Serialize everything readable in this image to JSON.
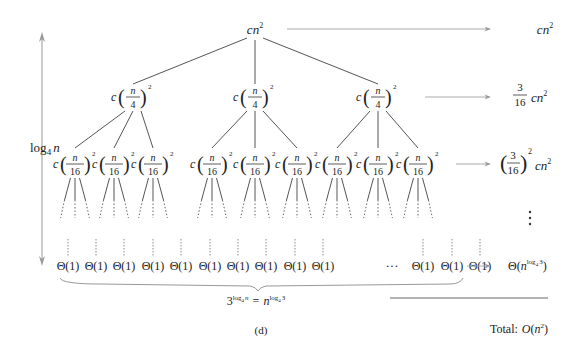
{
  "figure": {
    "caption": "(d)",
    "root": {
      "c": "c",
      "n": "n",
      "exp": "2"
    },
    "level1_node": {
      "c": "c",
      "num": "n",
      "den": "4",
      "exp": "2"
    },
    "level2_node": {
      "c": "c",
      "num": "n",
      "den": "16",
      "exp": "2"
    },
    "leaf_label": "Θ(1)",
    "ellipsis": "···",
    "height_label": {
      "base": "log",
      "sub": "4",
      "arg": "n"
    },
    "leaf_count": {
      "base": "3",
      "exp_log": "log",
      "exp_sub": "4",
      "exp_arg": "n",
      "eq": "=",
      "n": "n",
      "exp2_log": "log",
      "exp2_sub": "4",
      "exp2_arg": "3"
    },
    "level_costs": [
      {
        "label": "cn²",
        "c": "c",
        "n": "n",
        "exp": "2"
      },
      {
        "label": "3/16 cn²",
        "num": "3",
        "den": "16",
        "c": "c",
        "n": "n",
        "exp": "2"
      },
      {
        "label": "(3/16)² cn²",
        "num": "3",
        "den": "16",
        "exp_outer": "2",
        "c": "c",
        "n": "n",
        "exp": "2"
      },
      {
        "label": "⋮"
      },
      {
        "label": "Θ(n^log4 3)",
        "theta": "Θ(",
        "n": "n",
        "log": "log",
        "sub": "4",
        "arg": "3",
        "close": ")"
      }
    ],
    "total": {
      "prefix": "Total:",
      "o": "O",
      "open": "(",
      "n": "n",
      "exp": "2",
      "close": ")"
    }
  }
}
